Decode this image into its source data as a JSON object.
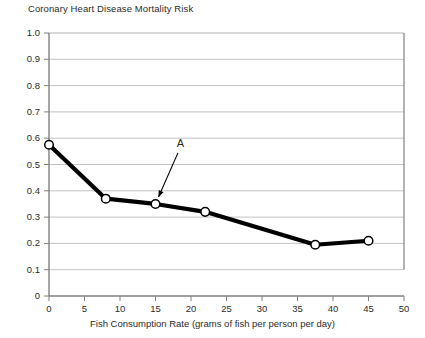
{
  "chart_data": {
    "type": "line",
    "title": "Coronary Heart Disease Mortality Risk",
    "xlabel": "Fish Consumption Rate (grams of fish per person per day)",
    "ylabel": "",
    "xlim": [
      0,
      50
    ],
    "ylim": [
      0,
      1.0
    ],
    "grid": true,
    "legend": "none",
    "x_ticks": [
      "0",
      "5",
      "10",
      "15",
      "20",
      "25",
      "30",
      "35",
      "40",
      "45",
      "50"
    ],
    "x_tick_values": [
      0,
      5,
      10,
      15,
      20,
      25,
      30,
      35,
      40,
      45,
      50
    ],
    "y_ticks": [
      "0",
      "0.1",
      "0.2",
      "0.3",
      "0.4",
      "0.5",
      "0.6",
      "0.7",
      "0.8",
      "0.9",
      "1.0"
    ],
    "y_tick_values": [
      0,
      0.1,
      0.2,
      0.3,
      0.4,
      0.5,
      0.6,
      0.7,
      0.8,
      0.9,
      1.0
    ],
    "x": [
      0,
      8,
      15,
      22,
      37.5,
      45
    ],
    "values": [
      0.575,
      0.37,
      0.35,
      0.32,
      0.195,
      0.21
    ],
    "series": [
      {
        "name": "Coronary Heart Disease Mortality Risk",
        "x": [
          0,
          8,
          15,
          22,
          37.5,
          45
        ],
        "values": [
          0.575,
          0.37,
          0.35,
          0.32,
          0.195,
          0.21
        ]
      }
    ],
    "annotations": [
      {
        "label": "A",
        "points_to_x": 15,
        "points_to_y": 0.35,
        "label_x": 18.5,
        "label_y": 0.565
      }
    ],
    "colors": {
      "line": "#000000",
      "marker_fill": "#ffffff",
      "marker_stroke": "#000000",
      "grid": "#b4b4b4",
      "axis": "#808080",
      "text": "#2b2b2b"
    }
  }
}
